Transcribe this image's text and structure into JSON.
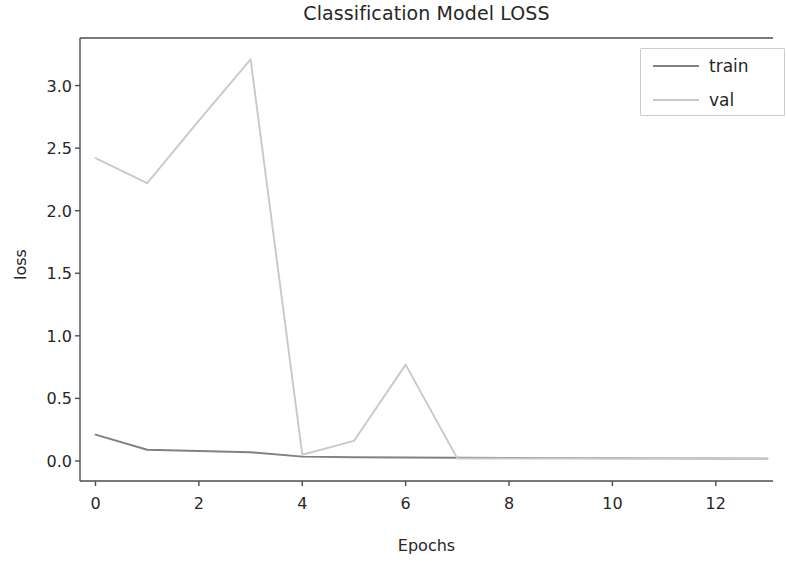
{
  "chart_data": {
    "type": "line",
    "title": "Classification Model LOSS",
    "xlabel": "Epochs",
    "ylabel": "loss",
    "x": [
      0,
      1,
      2,
      3,
      4,
      5,
      6,
      7,
      8,
      9,
      10,
      11,
      12,
      13
    ],
    "xlim": [
      -0.3,
      13.3
    ],
    "ylim": [
      -0.16,
      3.38
    ],
    "xticks": [
      0,
      2,
      4,
      6,
      8,
      10,
      12
    ],
    "xtick_labels": [
      "0",
      "2",
      "4",
      "6",
      "8",
      "10",
      "12"
    ],
    "yticks": [
      0.0,
      0.5,
      1.0,
      1.5,
      2.0,
      2.5,
      3.0
    ],
    "ytick_labels": [
      "0.0",
      "0.5",
      "1.0",
      "1.5",
      "2.0",
      "2.5",
      "3.0"
    ],
    "grid": false,
    "legend_position": "upper right",
    "series": [
      {
        "name": "train",
        "color": "#808080",
        "values": [
          0.21,
          0.09,
          0.08,
          0.07,
          0.035,
          0.03,
          0.028,
          0.026,
          0.024,
          0.023,
          0.022,
          0.021,
          0.02,
          0.019
        ]
      },
      {
        "name": "val",
        "color": "#c9c9c9",
        "values": [
          2.42,
          2.22,
          2.72,
          3.21,
          0.05,
          0.16,
          0.77,
          0.02,
          0.02,
          0.02,
          0.02,
          0.02,
          0.02,
          0.02
        ]
      }
    ]
  },
  "legend": {
    "entries": [
      {
        "label": "train",
        "color": "#808080"
      },
      {
        "label": "val",
        "color": "#c9c9c9"
      }
    ]
  },
  "axes": {
    "spine_color": "#4d4d4d",
    "background": "#ffffff"
  }
}
